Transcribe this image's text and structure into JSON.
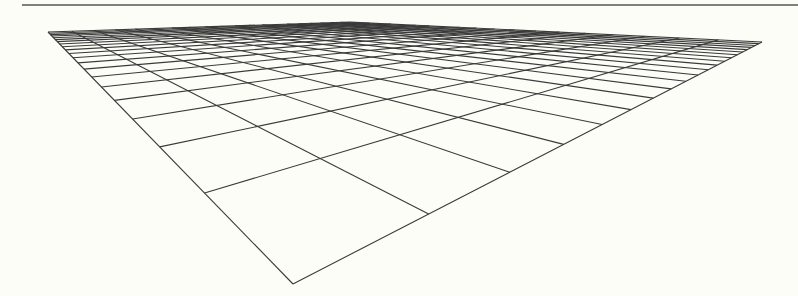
{
  "figure": {
    "kind": "perspective-grid",
    "background": "#fdfdf7",
    "line_color": "#3a3a3a",
    "top_rule": {
      "x1": 22,
      "y1": 5,
      "x2": 798,
      "y2": 5,
      "color": "#555555"
    },
    "grid": {
      "divisions_u": 20,
      "divisions_v": 20,
      "corners": {
        "near": [
          293,
          284
        ],
        "right": [
          762,
          42
        ],
        "left": [
          48,
          32
        ],
        "far": [
          350,
          22
        ]
      }
    }
  }
}
